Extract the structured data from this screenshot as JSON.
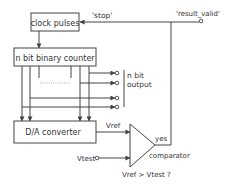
{
  "diagram": {
    "blocks": {
      "clock": "clock pulses",
      "counter": "n bit binary counter",
      "dac": "D/A converter",
      "comparator": "comparator"
    },
    "signals": {
      "stop": "'stop'",
      "result_valid": "'result_valid'",
      "vref": "Vref",
      "vtest": "Vtest",
      "yes": "yes",
      "condition": "Vref > Vtest ?"
    },
    "output_label": {
      "line1": "n bit",
      "line2": "output"
    },
    "colors": {
      "stroke": "#444444",
      "text": "#333333",
      "background": "#ffffff"
    }
  }
}
